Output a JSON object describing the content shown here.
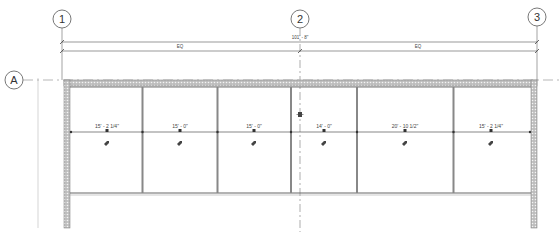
{
  "drawing": {
    "type": "floor-plan",
    "colors": {
      "line": "#555555",
      "wall_hatch": "#8a8a8a",
      "background": "#ffffff"
    },
    "grid_lines": [
      {
        "id": "1",
        "label": "1",
        "orientation": "vertical"
      },
      {
        "id": "2",
        "label": "2",
        "orientation": "vertical"
      },
      {
        "id": "3",
        "label": "3",
        "orientation": "vertical"
      },
      {
        "id": "A",
        "label": "A",
        "orientation": "horizontal"
      }
    ],
    "dimensions": {
      "overall": "101' - 8\"",
      "eq_left": "EQ",
      "eq_right": "EQ"
    },
    "rooms": [
      {
        "width_label": "15' - 2 1/4\""
      },
      {
        "width_label": "15' - 0\""
      },
      {
        "width_label": "15' - 0\""
      },
      {
        "width_label": "14' - 0\""
      },
      {
        "width_label": "20' - 10 1/2\""
      },
      {
        "width_label": "15' - 2 1/4\""
      }
    ]
  }
}
